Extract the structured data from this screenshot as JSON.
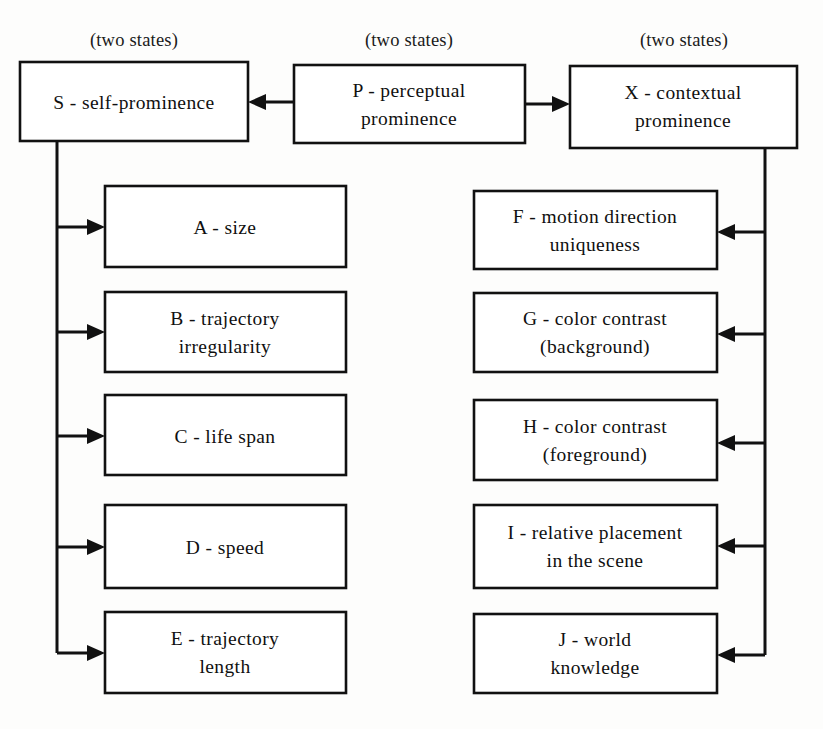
{
  "diagram": {
    "captions": [
      {
        "id": "caption-s",
        "text": "(two states)",
        "x": 134,
        "y": 40
      },
      {
        "id": "caption-p",
        "text": "(two states)",
        "x": 409,
        "y": 40
      },
      {
        "id": "caption-x",
        "text": "(two states)",
        "x": 684,
        "y": 40
      }
    ],
    "top_nodes": [
      {
        "id": "node-s",
        "key": "S",
        "label": "S - self-prominence",
        "lines": [
          "S - self-prominence"
        ],
        "x": 20,
        "y": 62,
        "w": 228,
        "h": 79
      },
      {
        "id": "node-p",
        "key": "P",
        "label": "P - perceptual prominence",
        "lines": [
          "P - perceptual",
          "prominence"
        ],
        "x": 294,
        "y": 65,
        "w": 231,
        "h": 78
      },
      {
        "id": "node-x",
        "key": "X",
        "label": "X - contextual prominence",
        "lines": [
          "X - contextual",
          "prominence"
        ],
        "x": 570,
        "y": 66,
        "w": 227,
        "h": 82
      }
    ],
    "left_nodes": [
      {
        "id": "node-a",
        "key": "A",
        "label": "A - size",
        "lines": [
          "A - size"
        ],
        "x": 105,
        "y": 186,
        "w": 241,
        "h": 81
      },
      {
        "id": "node-b",
        "key": "B",
        "label": "B - trajectory irregularity",
        "lines": [
          "B - trajectory",
          "irregularity"
        ],
        "x": 105,
        "y": 292,
        "w": 241,
        "h": 80
      },
      {
        "id": "node-c",
        "key": "C",
        "label": "C - life span",
        "lines": [
          "C - life span"
        ],
        "x": 105,
        "y": 395,
        "w": 241,
        "h": 80
      },
      {
        "id": "node-d",
        "key": "D",
        "label": "D - speed",
        "lines": [
          "D - speed"
        ],
        "x": 105,
        "y": 505,
        "w": 241,
        "h": 83
      },
      {
        "id": "node-e",
        "key": "E",
        "label": "E - trajectory length",
        "lines": [
          "E - trajectory",
          "length"
        ],
        "x": 105,
        "y": 612,
        "w": 241,
        "h": 81
      }
    ],
    "right_nodes": [
      {
        "id": "node-f",
        "key": "F",
        "label": "F - motion direction uniqueness",
        "lines": [
          "F - motion direction",
          "uniqueness"
        ],
        "x": 474,
        "y": 191,
        "w": 243,
        "h": 78
      },
      {
        "id": "node-g",
        "key": "G",
        "label": "G - color contrast (background)",
        "lines": [
          "G - color contrast",
          "(background)"
        ],
        "x": 474,
        "y": 293,
        "w": 243,
        "h": 79
      },
      {
        "id": "node-h",
        "key": "H",
        "label": "H - color contrast (foreground)",
        "lines": [
          "H - color contrast",
          "(foreground)"
        ],
        "x": 474,
        "y": 400,
        "w": 243,
        "h": 80
      },
      {
        "id": "node-i",
        "key": "I",
        "label": "I - relative placement in the scene",
        "lines": [
          "I - relative placement",
          "in the scene"
        ],
        "x": 474,
        "y": 505,
        "w": 243,
        "h": 83
      },
      {
        "id": "node-j",
        "key": "J",
        "label": "J - world knowledge",
        "lines": [
          "J - world",
          "knowledge"
        ],
        "x": 474,
        "y": 614,
        "w": 243,
        "h": 79
      }
    ],
    "edges": [
      {
        "id": "edge-p-to-s",
        "from": "P",
        "to": "S",
        "direction": "left"
      },
      {
        "id": "edge-p-to-x",
        "from": "P",
        "to": "X",
        "direction": "right"
      },
      {
        "id": "edge-s-to-a",
        "from": "S",
        "to": "A",
        "direction": "right"
      },
      {
        "id": "edge-s-to-b",
        "from": "S",
        "to": "B",
        "direction": "right"
      },
      {
        "id": "edge-s-to-c",
        "from": "S",
        "to": "C",
        "direction": "right"
      },
      {
        "id": "edge-s-to-d",
        "from": "S",
        "to": "D",
        "direction": "right"
      },
      {
        "id": "edge-s-to-e",
        "from": "S",
        "to": "E",
        "direction": "right"
      },
      {
        "id": "edge-x-to-f",
        "from": "X",
        "to": "F",
        "direction": "left"
      },
      {
        "id": "edge-x-to-g",
        "from": "X",
        "to": "G",
        "direction": "left"
      },
      {
        "id": "edge-x-to-h",
        "from": "X",
        "to": "H",
        "direction": "left"
      },
      {
        "id": "edge-x-to-i",
        "from": "X",
        "to": "I",
        "direction": "left"
      },
      {
        "id": "edge-x-to-j",
        "from": "X",
        "to": "J",
        "direction": "left"
      }
    ]
  }
}
